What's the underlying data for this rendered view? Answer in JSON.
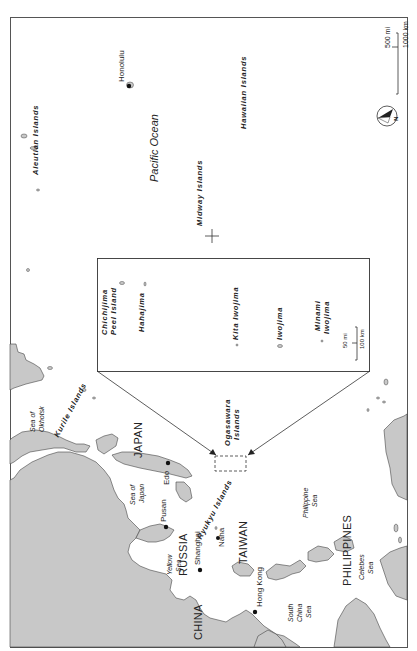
{
  "map": {
    "orientation": "rotated 90 degrees counter-clockwise",
    "colors": {
      "land": "#c8c8c8",
      "water": "#ffffff",
      "outline": "#444444",
      "frame": "#555555"
    },
    "countries": [
      {
        "id": "russia",
        "label": "RUSSIA"
      },
      {
        "id": "japan",
        "label": "JAPAN"
      },
      {
        "id": "china",
        "label": "CHINA"
      },
      {
        "id": "taiwan",
        "label": "TAIWAN"
      },
      {
        "id": "philippines",
        "label": "PHILIPPINES"
      }
    ],
    "seas": [
      {
        "id": "okhotsk",
        "line1": "Sea of",
        "line2": "Okhotsk"
      },
      {
        "id": "japan-sea",
        "line1": "Sea of",
        "line2": "Japan"
      },
      {
        "id": "yellow",
        "line1": "Yellow",
        "line2": "Sea"
      },
      {
        "id": "south-china",
        "line1": "South",
        "line2": "China",
        "line3": "Sea"
      },
      {
        "id": "philippine",
        "line1": "Philippine",
        "line2": "Sea"
      },
      {
        "id": "celebes",
        "line1": "Celebes",
        "line2": "Sea"
      },
      {
        "id": "pacific",
        "label": "Pacific Ocean"
      }
    ],
    "island_groups": [
      {
        "id": "aleutian",
        "label": "Aleutian Islands"
      },
      {
        "id": "hawaiian",
        "label": "Hawaiian Islands"
      },
      {
        "id": "midway",
        "label": "Midway Islands"
      },
      {
        "id": "kurile",
        "label": "Kurile Islands"
      },
      {
        "id": "ryukyu",
        "label": "Ryukyu Islands"
      },
      {
        "id": "ogasawara",
        "line1": "Ogasawara",
        "line2": "Islands"
      }
    ],
    "cities": [
      {
        "id": "edo",
        "label": "Edo"
      },
      {
        "id": "pusan",
        "label": "Pusan"
      },
      {
        "id": "shanghai",
        "label": "Shanghai"
      },
      {
        "id": "naha",
        "label": "Naha"
      },
      {
        "id": "hong-kong",
        "label": "Hong Kong"
      },
      {
        "id": "honolulu",
        "label": "Honolulu"
      }
    ],
    "scale": {
      "mi": "500 mi",
      "km": "1000 km"
    },
    "compass": {
      "label": "N"
    },
    "inset": {
      "islands": [
        {
          "id": "chichijima",
          "line1": "Chichijima",
          "line2": "Peel Island"
        },
        {
          "id": "hahajima",
          "label": "Hahajima"
        },
        {
          "id": "kita-iwojima",
          "label": "Kita Iwojima"
        },
        {
          "id": "iwojima",
          "label": "Iwojima"
        },
        {
          "id": "minami-iwojima",
          "line1": "Minami",
          "line2": "Iwojima"
        }
      ],
      "scale": {
        "mi": "50 mi",
        "km": "100 km"
      }
    }
  }
}
